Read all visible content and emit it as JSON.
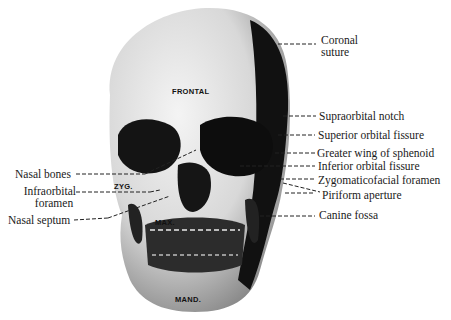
{
  "figure": {
    "bone_labels": {
      "frontal": "FRONTAL",
      "zygomatic": "ZYG.",
      "maxilla": "MAX.",
      "mandible": "MAND."
    },
    "right_labels": [
      {
        "line1": "Coronal",
        "line2": "suture"
      },
      {
        "line1": "Supraorbital notch"
      },
      {
        "line1": "Superior orbital fissure"
      },
      {
        "line1": "Greater wing of sphenoid"
      },
      {
        "line1": "Inferior orbital fissure"
      },
      {
        "line1": "Zygomaticofacial foramen"
      },
      {
        "line1": "Piriform aperture"
      },
      {
        "line1": "Canine fossa"
      }
    ],
    "left_labels": [
      {
        "line1": "Nasal bones"
      },
      {
        "line1": "Infraorbital",
        "line2": "foramen"
      },
      {
        "line1": "Nasal septum"
      }
    ],
    "colors": {
      "bone_light": "#e8e8e8",
      "shadow": "#111111",
      "line": "#222222",
      "background": "#ffffff"
    }
  }
}
